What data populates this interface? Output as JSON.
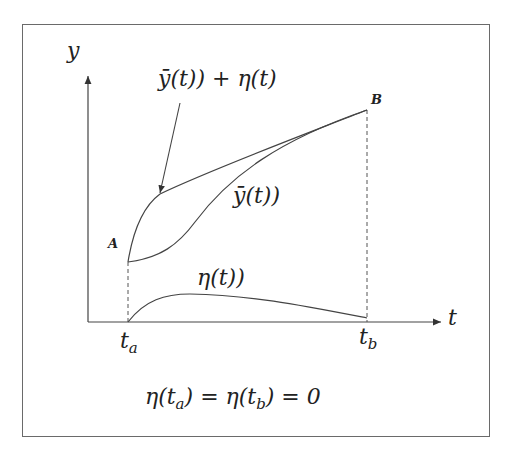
{
  "diagram": {
    "y_axis_label": "y",
    "x_axis_label": "t",
    "point_a_label": "A",
    "point_b_label": "B",
    "curve_perturbed_label": "ȳ(t)) + η(t)",
    "curve_optimal_label": "ȳ(t))",
    "curve_eta_label": "η(t))",
    "tick_ta": {
      "base": "t",
      "sub": "a"
    },
    "tick_tb": {
      "base": "t",
      "sub": "b"
    },
    "boundary_condition": {
      "p1": "η(t",
      "s1": "a",
      "p2": ") = η(t",
      "s2": "b",
      "p3": ") = 0"
    },
    "colors": {
      "line": "#444444",
      "frame": "#6a6a6a",
      "text": "#222222"
    }
  }
}
